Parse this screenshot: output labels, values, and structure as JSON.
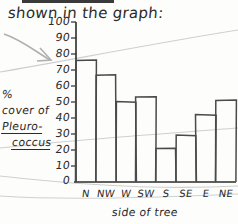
{
  "header": {
    "title_text": "shown in the graph:"
  },
  "annotations": {
    "arrow_name": "gray-arrow-pointing-to-axis",
    "ink_color": "#2b2b2b",
    "pencil_color": "#b9b9b9",
    "paper_color": "#fdfdfb"
  },
  "chart_data": {
    "type": "bar",
    "title": "",
    "xlabel": "side of tree",
    "ylabel_lines": [
      "%",
      "cover of",
      "Pleuro-",
      "coccus"
    ],
    "ylabel": "% cover of Pleurococcus",
    "categories": [
      "N",
      "NW",
      "W",
      "SW",
      "S",
      "SE",
      "E",
      "NE"
    ],
    "values": [
      76,
      67,
      50,
      53,
      21,
      29,
      42,
      51
    ],
    "ylim": [
      0,
      100
    ],
    "ytick_labels": [
      "100",
      "90",
      "80",
      "70",
      "60",
      "50",
      "40",
      "30",
      "20",
      "10",
      "0"
    ],
    "ytick_values": [
      100,
      90,
      80,
      70,
      60,
      50,
      40,
      30,
      20,
      10,
      0
    ],
    "grid": false,
    "legend": null
  }
}
